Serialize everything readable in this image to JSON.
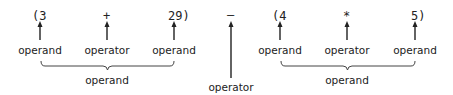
{
  "expression": {
    "left_group": {
      "tokens": [
        {
          "text": "(3",
          "role": "operand"
        },
        {
          "text": "+",
          "role": "operator"
        },
        {
          "text": "29)",
          "role": "operand"
        }
      ],
      "labels": [
        "operand",
        "operator",
        "operand"
      ],
      "group_label": "operand"
    },
    "middle": {
      "token": "–",
      "label": "operator"
    },
    "right_group": {
      "tokens": [
        {
          "text": "(4",
          "role": "operand"
        },
        {
          "text": "*",
          "role": "operator"
        },
        {
          "text": "5)",
          "role": "operand"
        }
      ],
      "labels": [
        "operand",
        "operator",
        "operand"
      ],
      "group_label": "operand"
    }
  },
  "colors": {
    "ink": "#222222",
    "background": "#ffffff"
  }
}
